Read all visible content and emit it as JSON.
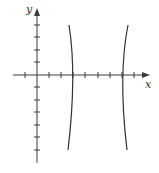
{
  "figure": {
    "x_axis_label": "x",
    "y_axis_label": "y",
    "origin_px": [
      37,
      75
    ],
    "unit_px": 12.2,
    "x_ticks": [
      -1,
      1,
      2,
      3,
      4,
      5,
      6,
      7,
      8
    ],
    "y_ticks": [
      4,
      3,
      2,
      1,
      -1,
      -2,
      -3,
      -4,
      -5,
      -6
    ],
    "curve": {
      "type": "hyperbola",
      "center": [
        5,
        0
      ],
      "vertices": [
        [
          3,
          0
        ],
        [
          7,
          0
        ]
      ],
      "branches": [
        "left",
        "right"
      ],
      "color": "#333333"
    },
    "axis_color": "#3a3a3a"
  }
}
